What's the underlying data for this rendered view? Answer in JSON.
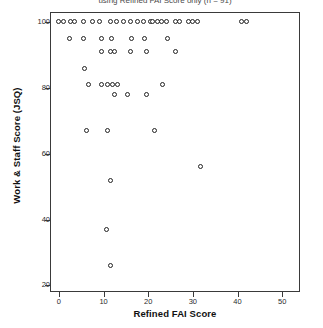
{
  "figure": {
    "title_partial": "using Refined FAI Score only (n = 91)"
  },
  "chart_data": {
    "type": "scatter",
    "title": "",
    "xlabel": "Refined FAI Score",
    "ylabel": "Work & Staff Score (JSQ)",
    "xlim": [
      -2,
      54
    ],
    "ylim": [
      18,
      103
    ],
    "xticks": [
      0,
      10,
      20,
      30,
      40,
      50
    ],
    "yticks": [
      20,
      40,
      60,
      80,
      100
    ],
    "grid": false,
    "legend": null,
    "marker": "open-circle",
    "marker_color": "#222222",
    "points": [
      [
        0,
        100
      ],
      [
        1,
        100
      ],
      [
        2.5,
        100
      ],
      [
        3.5,
        100
      ],
      [
        5.5,
        100
      ],
      [
        7.5,
        100
      ],
      [
        9,
        100
      ],
      [
        11.5,
        100
      ],
      [
        13,
        100
      ],
      [
        14.5,
        100
      ],
      [
        16,
        100
      ],
      [
        17.5,
        100
      ],
      [
        19,
        100
      ],
      [
        20.5,
        100
      ],
      [
        22,
        100
      ],
      [
        21,
        100
      ],
      [
        23,
        100
      ],
      [
        24,
        100
      ],
      [
        26,
        100
      ],
      [
        27,
        100
      ],
      [
        29,
        100
      ],
      [
        30,
        100
      ],
      [
        31,
        100
      ],
      [
        41,
        100
      ],
      [
        42,
        100
      ],
      [
        2.3,
        95
      ],
      [
        5.4,
        95
      ],
      [
        9.6,
        95
      ],
      [
        11.7,
        95
      ],
      [
        16.3,
        95
      ],
      [
        19.2,
        95
      ],
      [
        24.4,
        95
      ],
      [
        9.6,
        91
      ],
      [
        11.5,
        91
      ],
      [
        12.5,
        91
      ],
      [
        16,
        91
      ],
      [
        19.6,
        91
      ],
      [
        26,
        91
      ],
      [
        5.8,
        86
      ],
      [
        6.7,
        81
      ],
      [
        9.6,
        81
      ],
      [
        10.8,
        81
      ],
      [
        12,
        81
      ],
      [
        13.1,
        81
      ],
      [
        23.1,
        81
      ],
      [
        12.5,
        78
      ],
      [
        15.4,
        78
      ],
      [
        19.6,
        78
      ],
      [
        6.2,
        67
      ],
      [
        10.8,
        67
      ],
      [
        21.3,
        67
      ],
      [
        31.6,
        56
      ],
      [
        11.6,
        52
      ],
      [
        10.6,
        37
      ],
      [
        11.6,
        26
      ]
    ]
  },
  "axes": {
    "y_tick_labels": [
      "100",
      "80",
      "60",
      "40",
      "20"
    ],
    "x_tick_labels": [
      "0",
      "10",
      "20",
      "30",
      "40",
      "50"
    ]
  }
}
